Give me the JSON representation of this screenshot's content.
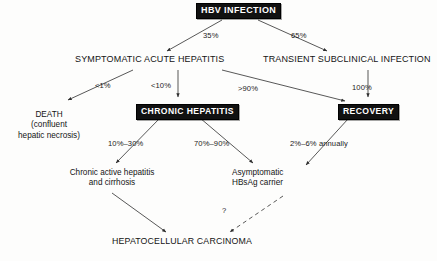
{
  "diagram": {
    "nodes": {
      "hbv_infection": "HBV INFECTION",
      "symptomatic_acute_hepatitis": "SYMPTOMATIC ACUTE HEPATITIS",
      "transient_subclinical_infection": "TRANSIENT SUBCLINICAL INFECTION",
      "death_line1": "DEATH",
      "death_line2": "(confluent",
      "death_line3": "hepatic necrosis)",
      "chronic_hepatitis": "CHRONIC HEPATITIS",
      "recovery": "RECOVERY",
      "chronic_active_line1": "Chronic active hepatitis",
      "chronic_active_line2": "and cirrhosis",
      "carrier_line1": "Asymptomatic",
      "carrier_line2": "HBsAg carrier",
      "hepatocellular_carcinoma": "HEPATOCELLULAR CARCINOMA"
    },
    "edge_labels": {
      "symptomatic_share": "35%",
      "subclinical_share": "65%",
      "death_rate": "<1%",
      "chronic_from_symptomatic": "<10%",
      "recovery_from_symptomatic": ">90%",
      "recovery_from_subclinical": "100%",
      "cirrhosis_rate": "10%–30%",
      "carrier_rate": "70%–90%",
      "carcinoma_annual_rate": "2%–6% annually",
      "uncertain": "?"
    },
    "colors": {
      "box_fill": "#111111",
      "box_text": "#ffffff",
      "edge": "#3a3a3a",
      "text": "#141414",
      "background": "#fdfdfc"
    }
  }
}
